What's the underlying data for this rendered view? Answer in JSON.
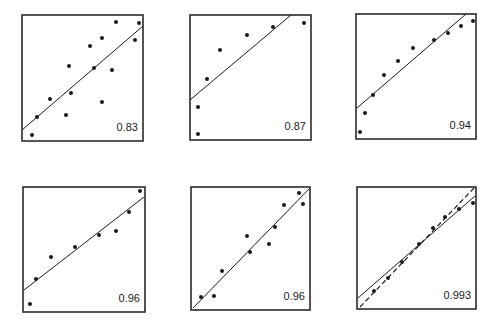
{
  "figure": {
    "background": "#ffffff",
    "ink_color": "#1a1a1a",
    "border_color": "#2a2a2a",
    "panel_count": 6,
    "layout": "2 rows x 3 columns"
  },
  "chart_data": [
    {
      "type": "scatter",
      "title": "",
      "xlabel": "",
      "ylabel": "",
      "grid": false,
      "annotation": "0.83",
      "frame": [
        22,
        15,
        143,
        141
      ],
      "points": [
        [
          32,
          135
        ],
        [
          37,
          117
        ],
        [
          50,
          99
        ],
        [
          66,
          115
        ],
        [
          69,
          66
        ],
        [
          71,
          93
        ],
        [
          90,
          46
        ],
        [
          94,
          68
        ],
        [
          102,
          38
        ],
        [
          102,
          102
        ],
        [
          112,
          70
        ],
        [
          116,
          22
        ],
        [
          135,
          40
        ],
        [
          139,
          23
        ]
      ],
      "lines": [
        {
          "style": "solid",
          "from": [
            22,
            130
          ],
          "to": [
            143,
            26
          ]
        }
      ]
    },
    {
      "type": "scatter",
      "title": "",
      "xlabel": "",
      "ylabel": "",
      "grid": false,
      "annotation": "0.87",
      "frame": [
        190,
        15,
        311,
        140
      ],
      "points": [
        [
          198,
          134
        ],
        [
          198,
          107
        ],
        [
          207,
          79
        ],
        [
          220,
          50
        ],
        [
          247,
          35
        ],
        [
          273,
          27
        ],
        [
          304,
          23
        ]
      ],
      "lines": [
        {
          "style": "solid",
          "from": [
            190,
            100
          ],
          "to": [
            291,
            15
          ]
        }
      ]
    },
    {
      "type": "scatter",
      "title": "",
      "xlabel": "",
      "ylabel": "",
      "grid": false,
      "annotation": "0.94",
      "frame": [
        356,
        14,
        476,
        139
      ],
      "points": [
        [
          360,
          132
        ],
        [
          365,
          113
        ],
        [
          373,
          95
        ],
        [
          384,
          75
        ],
        [
          398,
          61
        ],
        [
          413,
          48
        ],
        [
          434,
          40
        ],
        [
          448,
          33
        ],
        [
          461,
          26
        ],
        [
          473,
          21
        ]
      ],
      "lines": [
        {
          "style": "solid",
          "from": [
            357,
            108
          ],
          "to": [
            466,
            14
          ]
        }
      ]
    },
    {
      "type": "scatter",
      "title": "",
      "xlabel": "",
      "ylabel": "",
      "grid": false,
      "annotation": "0.96",
      "frame": [
        23,
        187,
        145,
        312
      ],
      "points": [
        [
          30,
          304
        ],
        [
          36,
          279
        ],
        [
          51,
          257
        ],
        [
          75,
          247
        ],
        [
          99,
          235
        ],
        [
          116,
          231
        ],
        [
          129,
          212
        ],
        [
          140,
          191
        ]
      ],
      "lines": [
        {
          "style": "solid",
          "from": [
            24,
            290
          ],
          "to": [
            144,
            197
          ]
        }
      ]
    },
    {
      "type": "scatter",
      "title": "",
      "xlabel": "",
      "ylabel": "",
      "grid": false,
      "annotation": "0.96",
      "frame": [
        191,
        187,
        310,
        310
      ],
      "points": [
        [
          201,
          297
        ],
        [
          214,
          296
        ],
        [
          222,
          271
        ],
        [
          247,
          236
        ],
        [
          250,
          252
        ],
        [
          269,
          244
        ],
        [
          275,
          227
        ],
        [
          284,
          205
        ],
        [
          299,
          193
        ],
        [
          303,
          204
        ]
      ],
      "lines": [
        {
          "style": "solid",
          "from": [
            193,
            308
          ],
          "to": [
            309,
            189
          ]
        }
      ]
    },
    {
      "type": "scatter",
      "title": "",
      "xlabel": "",
      "ylabel": "",
      "grid": false,
      "annotation": "0.993",
      "frame": [
        357,
        187,
        476,
        309
      ],
      "points": [
        [
          374,
          291
        ],
        [
          388,
          278
        ],
        [
          402,
          262
        ],
        [
          419,
          244
        ],
        [
          433,
          228
        ],
        [
          445,
          217
        ],
        [
          459,
          209
        ],
        [
          473,
          203
        ]
      ],
      "lines": [
        {
          "style": "solid",
          "from": [
            358,
            298
          ],
          "to": [
            475,
            196
          ]
        },
        {
          "style": "dashed",
          "from": [
            360,
            307
          ],
          "to": [
            475,
            187
          ]
        }
      ]
    }
  ]
}
